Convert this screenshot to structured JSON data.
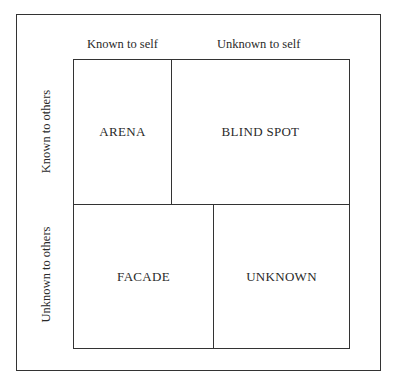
{
  "diagram": {
    "type": "johari-window",
    "column_labels": [
      "Known to self",
      "Unknown to self"
    ],
    "row_labels": [
      "Known to others",
      "Unknown to others"
    ],
    "quadrants": {
      "top_left": "ARENA",
      "top_right": "BLIND SPOT",
      "bottom_left": "FACADE",
      "bottom_right": "UNKNOWN"
    }
  }
}
